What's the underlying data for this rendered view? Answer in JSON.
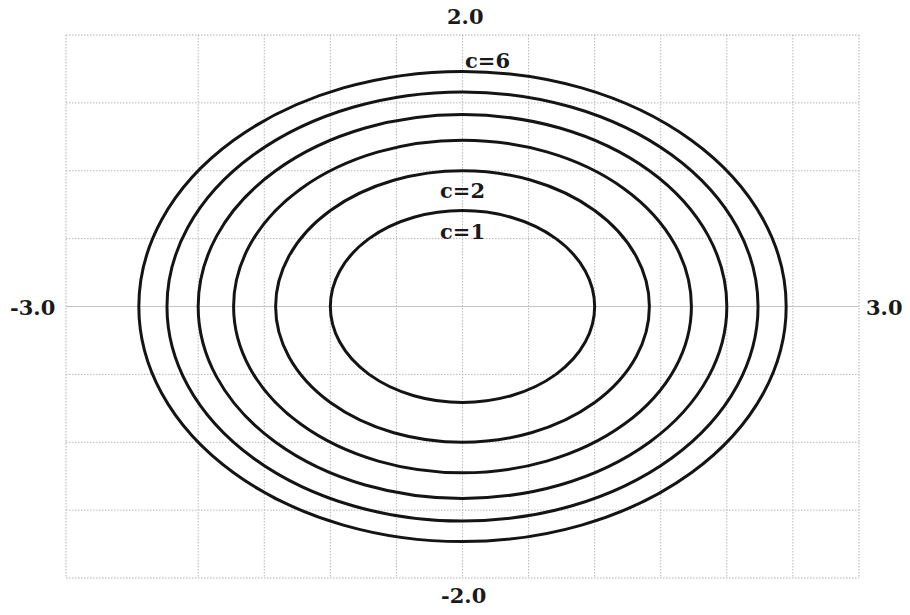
{
  "chart_data": {
    "type": "contour",
    "title": "",
    "function": "x^2 + 2y^2 = c",
    "xlabel": "",
    "ylabel": "",
    "xlim": [
      -3.0,
      3.0
    ],
    "ylim": [
      -2.0,
      2.0
    ],
    "grid": true,
    "grid_spacing": 0.5,
    "axis_tick_labels": {
      "top": "2.0",
      "bottom": "-2.0",
      "left": "-3.0",
      "right": "3.0"
    },
    "series": [
      {
        "name": "c=1",
        "c": 1,
        "semi_axis_x": 1.0,
        "semi_axis_y": 0.707
      },
      {
        "name": "c=2",
        "c": 2,
        "semi_axis_x": 1.414,
        "semi_axis_y": 1.0
      },
      {
        "name": "c=3",
        "c": 3,
        "semi_axis_x": 1.732,
        "semi_axis_y": 1.225
      },
      {
        "name": "c=4",
        "c": 4,
        "semi_axis_x": 2.0,
        "semi_axis_y": 1.414
      },
      {
        "name": "c=5",
        "c": 5,
        "semi_axis_x": 2.236,
        "semi_axis_y": 1.581
      },
      {
        "name": "c=6",
        "c": 6,
        "semi_axis_x": 2.449,
        "semi_axis_y": 1.732
      }
    ],
    "annotations": [
      {
        "text": "c=6",
        "x": 0.0,
        "y": 1.8
      },
      {
        "text": "c=2",
        "x": 0.0,
        "y": 0.85
      },
      {
        "text": "c=1",
        "x": 0.0,
        "y": 0.55
      }
    ],
    "legend": "none"
  },
  "labels": {
    "top": "2.0",
    "bottom": "-2.0",
    "left": "-3.0",
    "right": "3.0",
    "c6": "c=6",
    "c2": "c=2",
    "c1": "c=1"
  },
  "colors": {
    "curve": "#141414",
    "grid": "#b8b8b8",
    "axis": "#c4c4c4",
    "frame": "#b0b0b0",
    "text": "#1a1a1a"
  }
}
